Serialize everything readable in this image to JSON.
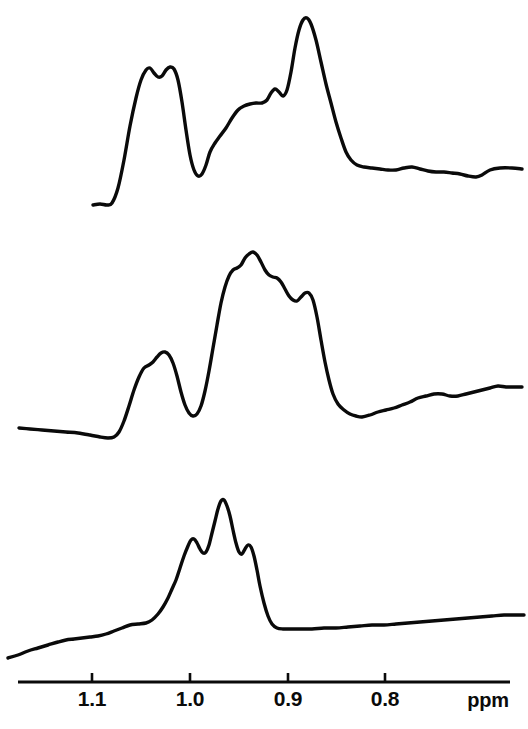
{
  "figure": {
    "title": "",
    "width": 528,
    "height": 729,
    "background": "#ffffff",
    "stroke_color": "#0a0a0a"
  },
  "axis": {
    "name": "ppm-axis",
    "unit_label": "ppm",
    "unit_label_x": 488,
    "unit_label_y": 707,
    "line": {
      "x1": 18,
      "x2": 510,
      "y": 682
    },
    "tick_height": 9,
    "tick_label_y": 706,
    "direction": "decreasing-left-to-right",
    "ticks": [
      {
        "value": "1.1",
        "x": 92
      },
      {
        "value": "1.0",
        "x": 190
      },
      {
        "value": "0.9",
        "x": 288
      },
      {
        "value": "0.8",
        "x": 385
      }
    ],
    "ppm_per_pixel": 0.001024,
    "ppm_at_x0": 1.194
  },
  "chart_data": {
    "type": "line",
    "title": "",
    "xlabel": "ppm",
    "ylabel": "",
    "grid": false,
    "legend": "none",
    "xlim": [
      1.194,
      0.654
    ],
    "x_axis_ticks": [
      1.1,
      1.0,
      0.9,
      0.8
    ],
    "x_axis_inverted": true,
    "series": [
      {
        "name": "trace-top",
        "label": "",
        "baseline_y_px": 205,
        "peaks_ppm": [
          1.137,
          1.112,
          0.941,
          0.958,
          1.053
        ],
        "points_px": [
          [
            93,
            205
          ],
          [
            100,
            204
          ],
          [
            107,
            205
          ],
          [
            112,
            203
          ],
          [
            118,
            188
          ],
          [
            124,
            160
          ],
          [
            130,
            126
          ],
          [
            136,
            98
          ],
          [
            141,
            80
          ],
          [
            146,
            70
          ],
          [
            150,
            68
          ],
          [
            154,
            73
          ],
          [
            158,
            77
          ],
          [
            162,
            76
          ],
          [
            166,
            70
          ],
          [
            170,
            67
          ],
          [
            174,
            69
          ],
          [
            178,
            80
          ],
          [
            182,
            102
          ],
          [
            186,
            130
          ],
          [
            190,
            155
          ],
          [
            194,
            170
          ],
          [
            198,
            176
          ],
          [
            202,
            174
          ],
          [
            206,
            165
          ],
          [
            210,
            152
          ],
          [
            215,
            143
          ],
          [
            220,
            136
          ],
          [
            226,
            128
          ],
          [
            232,
            118
          ],
          [
            238,
            110
          ],
          [
            244,
            106
          ],
          [
            250,
            104
          ],
          [
            256,
            103
          ],
          [
            262,
            103
          ],
          [
            267,
            100
          ],
          [
            271,
            93
          ],
          [
            275,
            89
          ],
          [
            279,
            92
          ],
          [
            283,
            96
          ],
          [
            287,
            90
          ],
          [
            291,
            72
          ],
          [
            295,
            48
          ],
          [
            299,
            30
          ],
          [
            303,
            20
          ],
          [
            307,
            18
          ],
          [
            311,
            24
          ],
          [
            316,
            40
          ],
          [
            321,
            62
          ],
          [
            326,
            84
          ],
          [
            331,
            103
          ],
          [
            336,
            122
          ],
          [
            341,
            138
          ],
          [
            346,
            152
          ],
          [
            351,
            160
          ],
          [
            357,
            165
          ],
          [
            364,
            167
          ],
          [
            372,
            168
          ],
          [
            380,
            169
          ],
          [
            388,
            170
          ],
          [
            396,
            170
          ],
          [
            404,
            168
          ],
          [
            412,
            167
          ],
          [
            420,
            169
          ],
          [
            428,
            171
          ],
          [
            436,
            172
          ],
          [
            444,
            172
          ],
          [
            452,
            173
          ],
          [
            460,
            174
          ],
          [
            468,
            176
          ],
          [
            476,
            177
          ],
          [
            482,
            175
          ],
          [
            490,
            170
          ],
          [
            500,
            168
          ],
          [
            512,
            168
          ],
          [
            522,
            169
          ]
        ]
      },
      {
        "name": "trace-middle",
        "label": "",
        "baseline_y_px": 428,
        "peaks_ppm": [
          1.083,
          0.978,
          0.957,
          0.925
        ],
        "points_px": [
          [
            19,
            428
          ],
          [
            30,
            429
          ],
          [
            42,
            430
          ],
          [
            54,
            431
          ],
          [
            66,
            432
          ],
          [
            78,
            433
          ],
          [
            90,
            435
          ],
          [
            100,
            437
          ],
          [
            108,
            438
          ],
          [
            114,
            437
          ],
          [
            119,
            432
          ],
          [
            124,
            421
          ],
          [
            129,
            406
          ],
          [
            134,
            390
          ],
          [
            139,
            377
          ],
          [
            144,
            368
          ],
          [
            149,
            365
          ],
          [
            153,
            362
          ],
          [
            157,
            357
          ],
          [
            161,
            353
          ],
          [
            165,
            352
          ],
          [
            169,
            355
          ],
          [
            173,
            363
          ],
          [
            177,
            376
          ],
          [
            181,
            392
          ],
          [
            185,
            405
          ],
          [
            189,
            413
          ],
          [
            193,
            416
          ],
          [
            197,
            414
          ],
          [
            201,
            406
          ],
          [
            205,
            391
          ],
          [
            209,
            371
          ],
          [
            213,
            348
          ],
          [
            217,
            325
          ],
          [
            221,
            303
          ],
          [
            225,
            287
          ],
          [
            229,
            276
          ],
          [
            233,
            270
          ],
          [
            237,
            268
          ],
          [
            241,
            265
          ],
          [
            245,
            258
          ],
          [
            249,
            254
          ],
          [
            253,
            252
          ],
          [
            257,
            255
          ],
          [
            261,
            262
          ],
          [
            265,
            270
          ],
          [
            269,
            275
          ],
          [
            273,
            277
          ],
          [
            277,
            278
          ],
          [
            281,
            282
          ],
          [
            285,
            289
          ],
          [
            289,
            296
          ],
          [
            293,
            300
          ],
          [
            297,
            301
          ],
          [
            301,
            297
          ],
          [
            305,
            293
          ],
          [
            309,
            293
          ],
          [
            313,
            300
          ],
          [
            317,
            317
          ],
          [
            321,
            340
          ],
          [
            325,
            362
          ],
          [
            329,
            380
          ],
          [
            333,
            394
          ],
          [
            338,
            404
          ],
          [
            344,
            410
          ],
          [
            350,
            414
          ],
          [
            356,
            416
          ],
          [
            362,
            417
          ],
          [
            370,
            415
          ],
          [
            378,
            412
          ],
          [
            386,
            410
          ],
          [
            394,
            408
          ],
          [
            402,
            405
          ],
          [
            410,
            402
          ],
          [
            418,
            398
          ],
          [
            426,
            396
          ],
          [
            434,
            394
          ],
          [
            442,
            394
          ],
          [
            450,
            396
          ],
          [
            458,
            396
          ],
          [
            466,
            394
          ],
          [
            474,
            392
          ],
          [
            482,
            390
          ],
          [
            490,
            388
          ],
          [
            498,
            386
          ],
          [
            506,
            387
          ],
          [
            514,
            387
          ],
          [
            522,
            387
          ]
        ]
      },
      {
        "name": "trace-bottom",
        "label": "",
        "baseline_y_px": 658,
        "peaks_ppm": [
          0.995,
          0.965,
          0.938
        ],
        "points_px": [
          [
            8,
            658
          ],
          [
            18,
            655
          ],
          [
            28,
            651
          ],
          [
            38,
            648
          ],
          [
            48,
            645
          ],
          [
            58,
            642
          ],
          [
            66,
            640
          ],
          [
            74,
            639
          ],
          [
            82,
            638
          ],
          [
            90,
            637
          ],
          [
            98,
            636
          ],
          [
            106,
            634
          ],
          [
            114,
            631
          ],
          [
            122,
            628
          ],
          [
            130,
            625
          ],
          [
            138,
            624
          ],
          [
            146,
            623
          ],
          [
            152,
            620
          ],
          [
            158,
            614
          ],
          [
            163,
            607
          ],
          [
            168,
            598
          ],
          [
            172,
            589
          ],
          [
            176,
            580
          ],
          [
            180,
            568
          ],
          [
            184,
            556
          ],
          [
            188,
            546
          ],
          [
            191,
            540
          ],
          [
            194,
            539
          ],
          [
            197,
            543
          ],
          [
            200,
            549
          ],
          [
            203,
            553
          ],
          [
            206,
            552
          ],
          [
            209,
            545
          ],
          [
            212,
            533
          ],
          [
            215,
            521
          ],
          [
            218,
            509
          ],
          [
            221,
            501
          ],
          [
            224,
            500
          ],
          [
            227,
            506
          ],
          [
            230,
            516
          ],
          [
            233,
            530
          ],
          [
            236,
            543
          ],
          [
            239,
            552
          ],
          [
            242,
            554
          ],
          [
            245,
            549
          ],
          [
            248,
            545
          ],
          [
            251,
            547
          ],
          [
            254,
            556
          ],
          [
            257,
            570
          ],
          [
            260,
            586
          ],
          [
            264,
            603
          ],
          [
            268,
            616
          ],
          [
            272,
            624
          ],
          [
            277,
            628
          ],
          [
            283,
            629
          ],
          [
            290,
            629
          ],
          [
            300,
            629
          ],
          [
            312,
            629
          ],
          [
            324,
            628
          ],
          [
            336,
            628
          ],
          [
            348,
            627
          ],
          [
            360,
            626
          ],
          [
            372,
            625
          ],
          [
            384,
            625
          ],
          [
            396,
            624
          ],
          [
            408,
            623
          ],
          [
            420,
            622
          ],
          [
            432,
            621
          ],
          [
            444,
            620
          ],
          [
            456,
            619
          ],
          [
            468,
            618
          ],
          [
            480,
            617
          ],
          [
            492,
            616
          ],
          [
            504,
            615
          ],
          [
            516,
            615
          ],
          [
            524,
            615
          ]
        ]
      }
    ]
  }
}
